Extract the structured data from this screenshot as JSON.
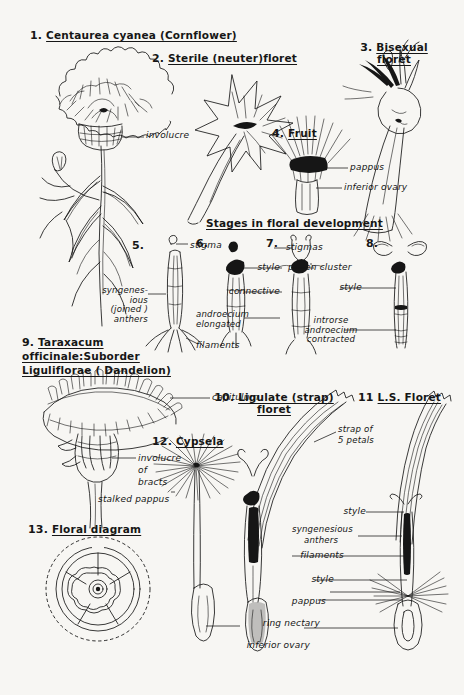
{
  "plate": {
    "title_domain": "botanical-illustration-compositae",
    "background": "#f7f6f3",
    "ink": "#161616"
  },
  "figures": [
    {
      "id": 1,
      "number": "1.",
      "title": "Centaurea cyanea (Cornflower)"
    },
    {
      "id": 2,
      "number": "2.",
      "title": "Sterile (neuter)floret"
    },
    {
      "id": 3,
      "number": "3.",
      "title": "Bisexual",
      "title2": "floret"
    },
    {
      "id": 4,
      "number": "4.",
      "title": "Fruit"
    },
    {
      "id": 5,
      "number": "5.",
      "title": ""
    },
    {
      "id": 6,
      "number": "6.",
      "title": ""
    },
    {
      "id": 7,
      "number": "7.",
      "title": ""
    },
    {
      "id": 8,
      "number": "8.",
      "title": ""
    },
    {
      "id": 9,
      "number": "9.",
      "title": "Taraxacum",
      "title2": "officinale:Suborder",
      "title3": "Liguliflorae ( Dandelion)"
    },
    {
      "id": 10,
      "number": "10.",
      "title": "Ligulate (strap)",
      "title2": "floret"
    },
    {
      "id": 11,
      "number": "11",
      "title": "L.S. Floret"
    },
    {
      "id": 12,
      "number": "12.",
      "title": "Cypsela"
    },
    {
      "id": 13,
      "number": "13.",
      "title": "Floral diagram"
    }
  ],
  "section_heading": "Stages in floral development",
  "annotations": {
    "involucre": "involucre",
    "pappus": "pappus",
    "inferior_ovary": "inferior ovary",
    "stigma": "stigma",
    "stigmas": "stigmas",
    "style": "style",
    "connective": "connective",
    "pollen_cluster": "pollen cluster",
    "androecium_elongated_a": "androecium",
    "androecium_elongated_b": "elongated",
    "introrse_a": "introrse",
    "introrse_b": "androecium",
    "introrse_c": "contracted",
    "syngenesious_a": "syngenes-",
    "syngenesious_b": "ious",
    "syngenesious_c": "(joined )",
    "syngenesious_d": "anthers",
    "filaments": "filaments",
    "capitulum": "capitulum",
    "involucre_of_a": "involucre",
    "involucre_of_b": "of",
    "involucre_of_c": "bracts",
    "stalked_pappus": "stalked pappus",
    "strap_a": "strap of",
    "strap_b": "5 petals",
    "syngenesious_anthers_a": "syngenesious",
    "syngenesious_anthers_b": "anthers",
    "filaments2": "filaments",
    "style2": "style",
    "style3": "style",
    "pappus2": "pappus",
    "ring_nectary": "ring nectary",
    "inferior_ovary2": "inferior ovary"
  }
}
